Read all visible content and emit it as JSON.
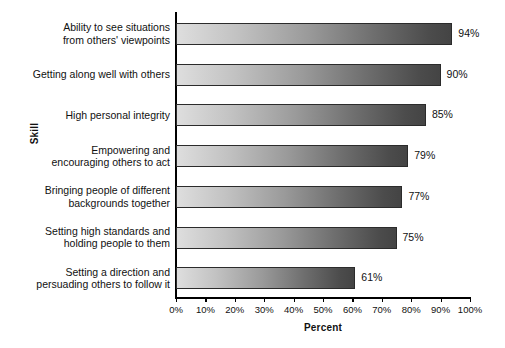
{
  "chart_data": {
    "type": "bar",
    "orientation": "horizontal",
    "title": "",
    "xlabel": "Percent",
    "ylabel": "Skill",
    "xlim": [
      0,
      100
    ],
    "grid": false,
    "legend": null,
    "categories": [
      "Ability to see situations\nfrom others' viewpoints",
      "Getting along well with others",
      "High personal integrity",
      "Empowering and\nencouraging others to act",
      "Bringing people of different\nbackgrounds together",
      "Setting high standards and\nholding people to them",
      "Setting a direction and\npersuading others to follow it"
    ],
    "values": [
      94,
      90,
      85,
      79,
      77,
      75,
      61
    ],
    "value_labels": [
      "94%",
      "90%",
      "85%",
      "79%",
      "77%",
      "75%",
      "61%"
    ],
    "xticks": [
      0,
      10,
      20,
      30,
      40,
      50,
      60,
      70,
      80,
      90,
      100
    ],
    "xtick_labels": [
      "0%",
      "10%",
      "20%",
      "30%",
      "40%",
      "50%",
      "60%",
      "70%",
      "80%",
      "90%",
      "100%"
    ],
    "colors": {
      "background": "#ffffff",
      "axis": "#000000",
      "text": "#111111",
      "bar_gradient_start": "#dedede",
      "bar_gradient_end": "#444444",
      "bar_border": "#2b2b2b",
      "bar_shadow": "rgba(0,0,0,0.13)"
    }
  }
}
